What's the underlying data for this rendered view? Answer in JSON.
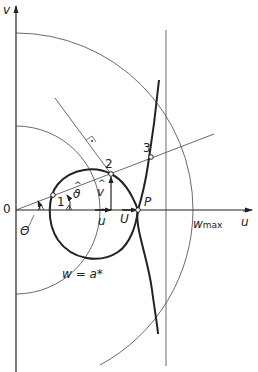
{
  "diagram": {
    "axes": {
      "x_label": "u",
      "x_hat": true,
      "y_label": "v",
      "y_hat": true,
      "origin_label": "0"
    },
    "points": [
      {
        "id": "1",
        "label": "1"
      },
      {
        "id": "2",
        "label": "2"
      },
      {
        "id": "3",
        "label": "3"
      },
      {
        "id": "P",
        "label": "P"
      }
    ],
    "labels": {
      "theta_upper": "Θ",
      "theta_lower": "ϑ",
      "u_hat_vec": "u",
      "v_hat_vec": "v",
      "u_vec": "U",
      "w_max_main": "w",
      "w_max_sub": "max",
      "w_eq": "w = a*"
    },
    "colors": {
      "line": "#222222",
      "thin": "#444444",
      "background": "#ffffff"
    }
  }
}
